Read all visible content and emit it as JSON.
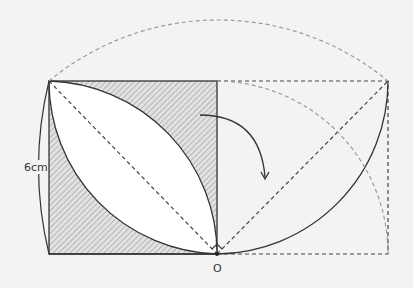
{
  "diagram": {
    "side_label": "6cm",
    "origin_label": "O",
    "colors": {
      "background": "#f3f3f3",
      "stroke": "#333333",
      "dashed_light": "#9a9a9a",
      "hatch_fill": "#d8d8d8",
      "lens_fill": "#ffffff"
    },
    "elements": [
      "square with hatched region outside lens",
      "lens formed by two quarter-circle arcs",
      "dashed diagonal of square",
      "dashed rotated square on right",
      "curved rotation arrow",
      "large dashed semicircle arc",
      "right quarter-circle dashed arc",
      "right semicircle solid arc"
    ]
  }
}
